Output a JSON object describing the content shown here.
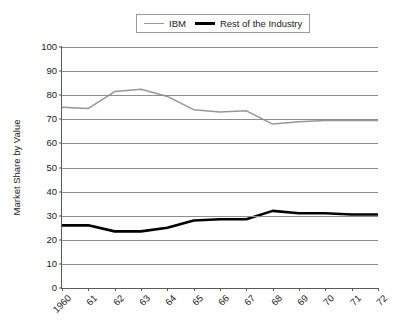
{
  "chart_data": {
    "type": "line",
    "title": "",
    "xlabel": "",
    "ylabel": "Market Share by Value",
    "ylim": [
      0,
      100
    ],
    "yticks": [
      0,
      10,
      20,
      30,
      40,
      50,
      60,
      70,
      80,
      90,
      100
    ],
    "ytick_labels": [
      "0",
      "10",
      "20",
      "30",
      "40",
      "50",
      "60",
      "70",
      "80",
      "90",
      "100"
    ],
    "grid": true,
    "legend_position": "top-center",
    "categories": [
      "1960",
      "61",
      "62",
      "63",
      "64",
      "65",
      "66",
      "67",
      "68",
      "69",
      "70",
      "71",
      "72"
    ],
    "series": [
      {
        "name": "IBM",
        "color": "#969696",
        "values": [
          75.0,
          74.5,
          81.5,
          82.5,
          79.5,
          74.0,
          73.0,
          73.5,
          68.0,
          69.0,
          69.5,
          69.5,
          69.5
        ]
      },
      {
        "name": "Rest of the Industry",
        "color": "#000000",
        "values": [
          26.0,
          26.0,
          23.5,
          23.5,
          25.0,
          28.0,
          28.5,
          28.5,
          32.0,
          31.0,
          31.0,
          30.5,
          30.5
        ]
      }
    ]
  },
  "legend": {
    "entries": [
      {
        "label": "IBM",
        "swatch": "gray-thin-line"
      },
      {
        "label": "Rest of the Industry",
        "swatch": "black-thick-line"
      }
    ]
  },
  "axes": {
    "y_title": "Market Share by Value"
  }
}
